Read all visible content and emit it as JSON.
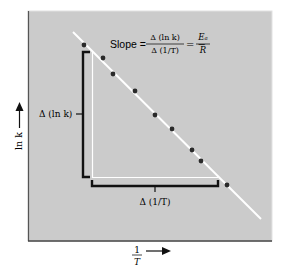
{
  "chart_data": {
    "type": "scatter",
    "title": "",
    "annotation": {
      "slope_label": "Slope =",
      "numerator": "Δ (ln k)",
      "denominator": "Δ (1/T)",
      "equals_neg": "= −",
      "rhs_numerator": "Eₐ",
      "rhs_denominator": "R"
    },
    "xlabel": {
      "numerator": "1",
      "denominator": "T"
    },
    "ylabel": "ln k",
    "delta_y_label": "Δ (ln k)",
    "delta_x_label": "Δ (1/T)",
    "grid": false,
    "fit_line": {
      "x1": 73,
      "y1": 32,
      "x2": 261,
      "y2": 219,
      "color": "#ffffff"
    },
    "points": [
      {
        "x": 84,
        "y": 45
      },
      {
        "x": 103,
        "y": 58
      },
      {
        "x": 113,
        "y": 74
      },
      {
        "x": 135,
        "y": 91
      },
      {
        "x": 155,
        "y": 115
      },
      {
        "x": 172,
        "y": 129
      },
      {
        "x": 192,
        "y": 150
      },
      {
        "x": 201,
        "y": 161
      },
      {
        "x": 227,
        "y": 185
      }
    ],
    "colors": {
      "plot_background": "#cbcbcb",
      "points": "#2a2a2a",
      "brackets": "#111111",
      "guides": "#ffffff"
    }
  }
}
